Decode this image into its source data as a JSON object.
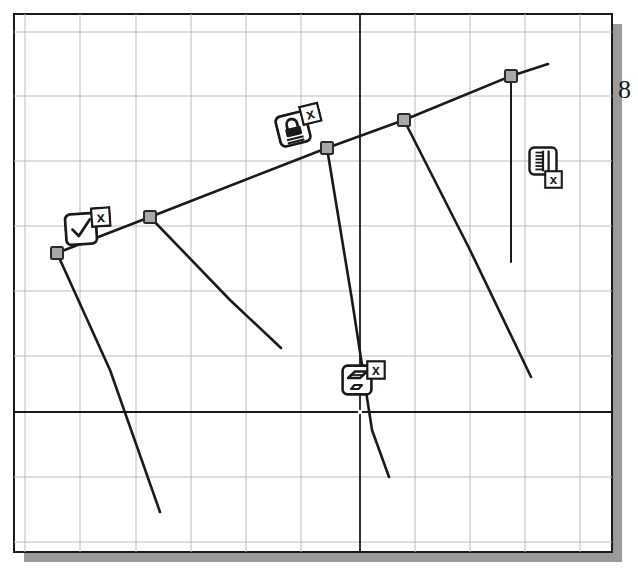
{
  "app": {
    "title": "Sketch Constraint Canvas",
    "background_color": "#ffffff",
    "paper_fill": "#ffffff",
    "paper_border_color": "#1a1a1a",
    "drop_shadow_color": "#9a9a9a",
    "grid_color": "#b9bcc4",
    "axis_color": "#1a1a1a",
    "geometry_color": "#1a1a1a",
    "node_fill": "#a8a8a8",
    "node_stroke": "#2a2a2a"
  },
  "drawing_area": {
    "name": "paper",
    "x": 14,
    "y": 14,
    "width": 598,
    "height": 538,
    "shadow_offset_x": 10,
    "shadow_offset_y": 10
  },
  "grid": {
    "visible": true,
    "cell_width": 55,
    "cell_height": 65,
    "origin_x": 360,
    "origin_y": 412,
    "vertical_lines": [
      25,
      80,
      136,
      191,
      246,
      301,
      415,
      470,
      525,
      580
    ],
    "horizontal_lines": [
      32,
      96,
      161,
      226,
      291,
      356,
      477,
      542
    ],
    "axis_label_fallback": ""
  },
  "axes": {
    "x_axis": {
      "name": "x-axis",
      "y": 412,
      "x_start": 14,
      "x_end": 612
    },
    "y_axis": {
      "name": "y-axis",
      "x": 360,
      "y_start": 14,
      "y_end": 552
    },
    "origin_marker": {
      "x": 360,
      "y": 412,
      "color": "#ffffff"
    }
  },
  "nodes": [
    {
      "id": "n1",
      "label": "point-1",
      "x": 57,
      "y": 253
    },
    {
      "id": "n2",
      "label": "point-2",
      "x": 150,
      "y": 217
    },
    {
      "id": "n3",
      "label": "point-3",
      "x": 327,
      "y": 148
    },
    {
      "id": "n4",
      "label": "point-4",
      "x": 404,
      "y": 120
    },
    {
      "id": "n5",
      "label": "point-5",
      "x": 511,
      "y": 76
    }
  ],
  "segments": [
    {
      "id": "s0",
      "label": "spine-polyline",
      "points": "57,253 150,217 327,148 404,120 511,76 548,64",
      "width": 2.6
    },
    {
      "id": "s1",
      "label": "branch-from-point-1",
      "points": "57,253 110,370 160,512",
      "width": 2.6
    },
    {
      "id": "s2",
      "label": "branch-from-point-2",
      "points": "150,217 230,300 281,348",
      "width": 2.6
    },
    {
      "id": "s3",
      "label": "branch-from-point-3",
      "points": "327,148 352,300 372,430 389,477",
      "width": 2.6
    },
    {
      "id": "s4",
      "label": "branch-from-point-4",
      "points": "404,120 470,250 531,377",
      "width": 2.6
    },
    {
      "id": "s5",
      "label": "vertical-dimension-line",
      "points": "511,76 511,262",
      "width": 2.0
    }
  ],
  "constraint_icons": [
    {
      "id": "c1",
      "name": "coincident-check-constraint",
      "glyph": "check-icon",
      "badge": "x-badge-icon",
      "x": 64,
      "y": 212,
      "size": 34,
      "rotation": -4,
      "badge_position": "top-right"
    },
    {
      "id": "c2",
      "name": "fix-lock-constraint",
      "glyph": "padlock-icon",
      "badge": "x-badge-icon",
      "x": 276,
      "y": 112,
      "size": 34,
      "rotation": -14,
      "badge_position": "top-right"
    },
    {
      "id": "c3",
      "name": "dimension-ruler-constraint",
      "glyph": "ruler-icon",
      "badge": "x-badge-icon",
      "x": 528,
      "y": 146,
      "size": 30,
      "rotation": 0,
      "badge_position": "bottom-right"
    },
    {
      "id": "c4",
      "name": "parallel-constraint",
      "glyph": "parallelogram-icon",
      "badge": "x-badge-icon",
      "x": 341,
      "y": 364,
      "size": 32,
      "rotation": 0,
      "badge_position": "top-right"
    }
  ],
  "margin_text": {
    "name": "page-edge-glyph",
    "value": "8",
    "x": 628,
    "y": 97
  }
}
